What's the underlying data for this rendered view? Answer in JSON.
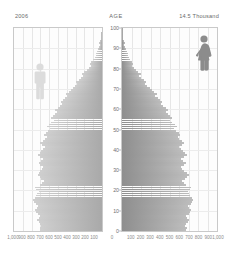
{
  "header": {
    "year": "2006",
    "age_axis_label": "AGE",
    "scale_note": "14.5 Thousand"
  },
  "icons": {
    "male": "male-figure-icon",
    "female": "female-figure-icon"
  },
  "colors": {
    "male_bar": "#bdbdbd",
    "female_bar": "#9a9a9a",
    "male_figure": "#d9d9d9",
    "female_figure": "#8c8c8c",
    "panel_border": "#c9c9c9",
    "grid": "#e6e6e6",
    "text": "#6b6b6b"
  },
  "chart_data": {
    "type": "bar",
    "title": "2006",
    "subtitle": "14.5 Thousand",
    "xlabel": "",
    "ylabel": "AGE",
    "orientation": "horizontal",
    "layout": "population-pyramid",
    "grid": true,
    "legend_position": "none",
    "ylim": [
      0,
      100
    ],
    "y_ticks": [
      0,
      10,
      20,
      30,
      40,
      50,
      60,
      70,
      80,
      90,
      100
    ],
    "xlim_left": [
      1000,
      0
    ],
    "xlim_right": [
      0,
      1000
    ],
    "x_ticks_left": [
      "1,000",
      "900",
      "800",
      "700",
      "600",
      "500",
      "400",
      "300",
      "200",
      "100"
    ],
    "x_ticks_left_values": [
      1000,
      900,
      800,
      700,
      600,
      500,
      400,
      300,
      200,
      100
    ],
    "x_ticks_right": [
      "100",
      "200",
      "300",
      "400",
      "500",
      "600",
      "700",
      "800",
      "900",
      "1,000"
    ],
    "x_ticks_right_values": [
      100,
      200,
      300,
      400,
      500,
      600,
      700,
      800,
      900,
      1000
    ],
    "zero_tick": "0",
    "ages": [
      0,
      1,
      2,
      3,
      4,
      5,
      6,
      7,
      8,
      9,
      10,
      11,
      12,
      13,
      14,
      15,
      16,
      17,
      18,
      19,
      20,
      21,
      22,
      23,
      24,
      25,
      26,
      27,
      28,
      29,
      30,
      31,
      32,
      33,
      34,
      35,
      36,
      37,
      38,
      39,
      40,
      41,
      42,
      43,
      44,
      45,
      46,
      47,
      48,
      49,
      50,
      51,
      52,
      53,
      54,
      55,
      56,
      57,
      58,
      59,
      60,
      61,
      62,
      63,
      64,
      65,
      66,
      67,
      68,
      69,
      70,
      71,
      72,
      73,
      74,
      75,
      76,
      77,
      78,
      79,
      80,
      81,
      82,
      83,
      84,
      85,
      86,
      87,
      88,
      89,
      90,
      91,
      92,
      93,
      94,
      95,
      96,
      97,
      98,
      99,
      100
    ],
    "series": [
      {
        "name": "Male",
        "side": "left",
        "values": [
          700,
          710,
          690,
          705,
          720,
          735,
          715,
          700,
          730,
          745,
          760,
          740,
          725,
          755,
          770,
          780,
          765,
          750,
          735,
          720,
          745,
          760,
          700,
          680,
          660,
          690,
          710,
          730,
          715,
          700,
          680,
          670,
          700,
          720,
          690,
          670,
          700,
          730,
          710,
          690,
          670,
          650,
          680,
          700,
          675,
          650,
          630,
          660,
          640,
          615,
          590,
          620,
          600,
          575,
          550,
          575,
          555,
          530,
          510,
          530,
          505,
          480,
          455,
          470,
          445,
          420,
          395,
          405,
          380,
          355,
          330,
          305,
          280,
          290,
          265,
          240,
          215,
          225,
          200,
          175,
          150,
          130,
          140,
          120,
          100,
          82,
          68,
          74,
          58,
          46,
          34,
          28,
          32,
          22,
          16,
          11,
          8,
          9,
          5,
          3,
          2
        ]
      },
      {
        "name": "Female",
        "side": "right",
        "values": [
          670,
          680,
          660,
          675,
          690,
          705,
          685,
          670,
          700,
          715,
          730,
          710,
          695,
          725,
          740,
          750,
          735,
          720,
          705,
          690,
          715,
          730,
          670,
          650,
          630,
          660,
          680,
          700,
          685,
          655,
          635,
          625,
          655,
          675,
          645,
          625,
          655,
          685,
          665,
          645,
          625,
          605,
          635,
          655,
          630,
          605,
          585,
          615,
          595,
          570,
          545,
          575,
          555,
          530,
          505,
          530,
          510,
          485,
          465,
          485,
          460,
          435,
          410,
          425,
          400,
          375,
          350,
          365,
          340,
          315,
          290,
          265,
          240,
          255,
          230,
          205,
          180,
          195,
          170,
          148,
          126,
          110,
          120,
          100,
          85,
          70,
          58,
          64,
          50,
          40,
          30,
          25,
          28,
          20,
          14,
          10,
          7,
          8,
          5,
          3,
          2
        ]
      }
    ],
    "annotations": [
      {
        "text": "14.5 Thousand",
        "role": "max-scale-note",
        "position": "top-right"
      },
      {
        "text": "2006",
        "role": "year",
        "position": "top-left"
      }
    ]
  }
}
